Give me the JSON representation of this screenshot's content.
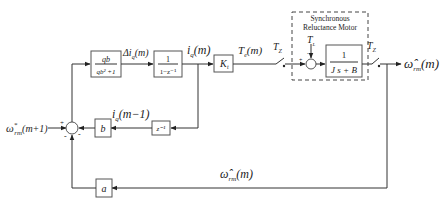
{
  "diagram": {
    "input": {
      "label": "ω*rm(m+1)",
      "base": "ω",
      "sup": "*",
      "sub": "rm",
      "arg": "(m+1)"
    },
    "summing_junction": {
      "signs": [
        "+",
        "-",
        "-"
      ]
    },
    "blocks": {
      "gain_q": {
        "numerator": "qb",
        "denominator": "qb² +1"
      },
      "integrator": {
        "numerator": "1",
        "denominator": "1−z⁻¹"
      },
      "torque_const": {
        "label": "K",
        "sub": "t"
      },
      "delay": {
        "label": "z⁻¹"
      },
      "gain_b": {
        "label": "b"
      },
      "gain_a": {
        "label": "a"
      },
      "motor_tf": {
        "numerator": "1",
        "denominator": "J s + B"
      }
    },
    "signals": {
      "delta_iq": {
        "prefix": "Δi",
        "sub": "q",
        "arg": "(m)"
      },
      "iq": {
        "base": "i",
        "sub": "q",
        "arg": "(m)"
      },
      "iq_prev": {
        "base": "i",
        "sub": "q",
        "arg": "(m−1)"
      },
      "te": {
        "base": "T",
        "sub": "e",
        "arg": "(m)"
      },
      "tl": {
        "base": "T",
        "sub": "L"
      },
      "sampler1": {
        "base": "T",
        "sub": "Z"
      },
      "sampler2": {
        "base": "T",
        "sub": "Z"
      },
      "output": {
        "base": "ω̂",
        "sub": "rm",
        "arg": "(m)"
      },
      "feedback": {
        "base": "ω̂",
        "sub": "rm",
        "arg": "(m)"
      }
    },
    "motor_box": {
      "line1": "Synchronous",
      "line2": "Reluctance Motor"
    },
    "motor_sum_sign": "+"
  }
}
